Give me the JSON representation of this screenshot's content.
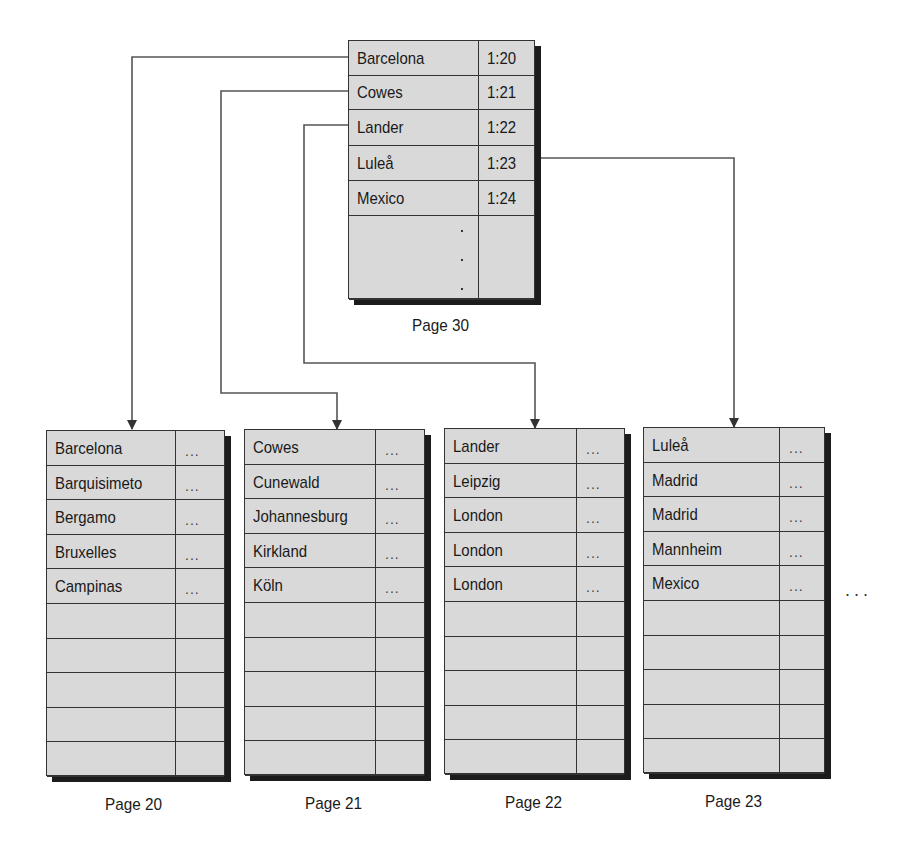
{
  "root_page": {
    "label": "Page 30",
    "entries": [
      {
        "key": "Barcelona",
        "pointer": "1:20"
      },
      {
        "key": "Cowes",
        "pointer": "1:21"
      },
      {
        "key": "Lander",
        "pointer": "1:22"
      },
      {
        "key": "Luleå",
        "pointer": "1:23"
      },
      {
        "key": "Mexico",
        "pointer": "1:24"
      }
    ]
  },
  "leaf_pages": [
    {
      "label": "Page 20",
      "entries": [
        "Barcelona",
        "Barquisimeto",
        "Bergamo",
        "Bruxelles",
        "Campinas"
      ],
      "value_placeholder": "..."
    },
    {
      "label": "Page 21",
      "entries": [
        "Cowes",
        "Cunewald",
        "Johannesburg",
        "Kirkland",
        "Köln"
      ],
      "value_placeholder": "..."
    },
    {
      "label": "Page 22",
      "entries": [
        "Lander",
        "Leipzig",
        "London",
        "London",
        "London"
      ],
      "value_placeholder": "..."
    },
    {
      "label": "Page 23",
      "entries": [
        "Luleå",
        "Madrid",
        "Madrid",
        "Mannheim",
        "Mexico"
      ],
      "value_placeholder": "..."
    }
  ],
  "continuation": "...",
  "colors": {
    "cell_fill": "#d9d9d9",
    "border": "#333333",
    "shadow": "#1c1c1c",
    "line": "#555555"
  }
}
